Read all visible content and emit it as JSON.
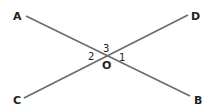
{
  "diagram": {
    "type": "intersecting-lines",
    "line_color": "#6b6b6b",
    "text_color": "#222222",
    "points": {
      "A": {
        "label": "A",
        "x": 26,
        "y": 16
      },
      "B": {
        "label": "B",
        "x": 190,
        "y": 96
      },
      "C": {
        "label": "C",
        "x": 24,
        "y": 98
      },
      "D": {
        "label": "D",
        "x": 188,
        "y": 15
      },
      "O": {
        "label": "O",
        "x": 107,
        "y": 56
      }
    },
    "lines": [
      {
        "name": "AB",
        "from": "A",
        "to": "B"
      },
      {
        "name": "CD",
        "from": "C",
        "to": "D"
      }
    ],
    "angles": [
      {
        "label": "1",
        "position": "right"
      },
      {
        "label": "2",
        "position": "left"
      },
      {
        "label": "3",
        "position": "top"
      }
    ]
  }
}
